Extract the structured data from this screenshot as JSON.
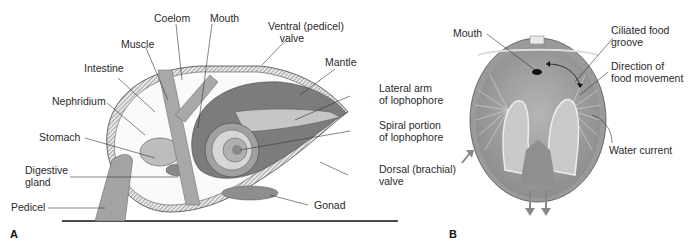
{
  "figure": {
    "panel_a": {
      "letter": "A",
      "labels": {
        "coelom": "Coelom",
        "mouth": "Mouth",
        "ventral_valve": "Ventral (pedicel)\n    valve",
        "muscle": "Muscle",
        "intestine": "Intestine",
        "mantle": "Mantle",
        "nephridium": "Nephridium",
        "lateral_arm": "Lateral arm\nof lophophore",
        "stomach": "Stomach",
        "spiral_portion": "Spiral portion\nof lophophore",
        "digestive_gland": "Digestive\ngland",
        "dorsal_valve": "Dorsal (brachial)\nvalve",
        "pedicel": "Pedicel",
        "gonad": "Gonad"
      }
    },
    "panel_b": {
      "letter": "B",
      "labels": {
        "mouth": "Mouth",
        "ciliated_groove": "Ciliated food\ngroove",
        "direction": "Direction of\nfood movement",
        "water_current": "Water current"
      }
    },
    "colors": {
      "tissue": "#9a9a9a",
      "dark_tissue": "#6e6e6e",
      "light_tissue": "#d2d2d2",
      "shell_fill": "#f4f4f4",
      "line": "#333333"
    }
  }
}
